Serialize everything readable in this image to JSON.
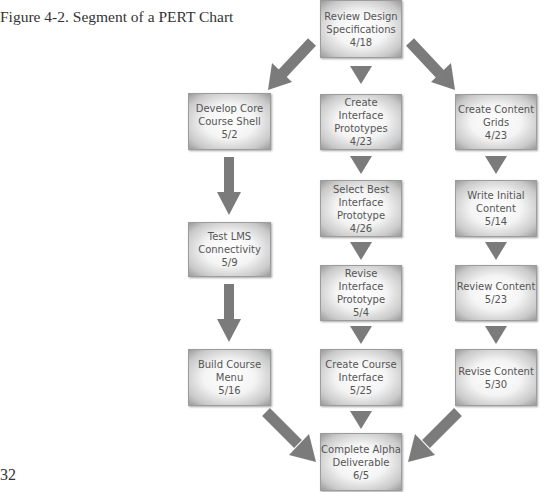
{
  "caption": "Figure 4-2. Segment of a PERT Chart",
  "page_number": "32",
  "colors": {
    "arrow": "#7b7b7b",
    "node_text": "#555555"
  },
  "nodes": {
    "review_design": {
      "lines": [
        "Review Design",
        "Specifications"
      ],
      "date": "4/18"
    },
    "develop_core": {
      "lines": [
        "Develop Core",
        "Course Shell"
      ],
      "date": "5/2"
    },
    "create_interface_prototypes": {
      "lines": [
        "Create Interface",
        "Prototypes"
      ],
      "date": "4/23"
    },
    "create_content_grids": {
      "lines": [
        "Create Content",
        "Grids"
      ],
      "date": "4/23"
    },
    "test_lms": {
      "lines": [
        "Test LMS",
        "Connectivity"
      ],
      "date": "5/9"
    },
    "select_best": {
      "lines": [
        "Select Best",
        "Interface",
        "Prototype"
      ],
      "date": "4/26"
    },
    "write_initial": {
      "lines": [
        "Write Initial",
        "Content"
      ],
      "date": "5/14"
    },
    "revise_interface": {
      "lines": [
        "Revise Interface",
        "Prototype"
      ],
      "date": "5/4"
    },
    "review_content": {
      "lines": [
        "Review Content"
      ],
      "date": "5/23"
    },
    "build_menu": {
      "lines": [
        "Build Course",
        "Menu"
      ],
      "date": "5/16"
    },
    "create_course_interface": {
      "lines": [
        "Create Course",
        "Interface"
      ],
      "date": "5/25"
    },
    "revise_content": {
      "lines": [
        "Revise Content"
      ],
      "date": "5/30"
    },
    "complete_alpha": {
      "lines": [
        "Complete Alpha",
        "Deliverable"
      ],
      "date": "6/5"
    }
  },
  "edges": [
    [
      "review_design",
      "develop_core"
    ],
    [
      "review_design",
      "create_interface_prototypes"
    ],
    [
      "review_design",
      "create_content_grids"
    ],
    [
      "develop_core",
      "test_lms"
    ],
    [
      "test_lms",
      "build_menu"
    ],
    [
      "create_interface_prototypes",
      "select_best"
    ],
    [
      "select_best",
      "revise_interface"
    ],
    [
      "revise_interface",
      "create_course_interface"
    ],
    [
      "create_content_grids",
      "write_initial"
    ],
    [
      "write_initial",
      "review_content"
    ],
    [
      "review_content",
      "revise_content"
    ],
    [
      "build_menu",
      "complete_alpha"
    ],
    [
      "create_course_interface",
      "complete_alpha"
    ],
    [
      "revise_content",
      "complete_alpha"
    ]
  ]
}
